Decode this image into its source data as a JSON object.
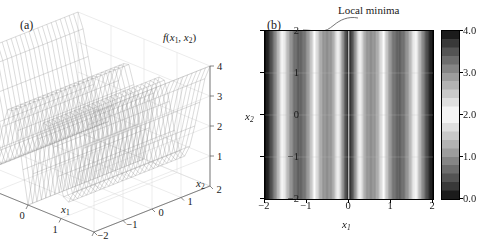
{
  "figure": {
    "panel_a_label": "(a)",
    "panel_b_label": "(b)"
  },
  "panel_a": {
    "z_axis_label": "f(x1, x2)",
    "z_ticks": [
      "4",
      "3",
      "2",
      "1"
    ],
    "x1_axis_label": "x1",
    "x1_ticks": [
      "-2",
      "-1",
      "0",
      "1",
      "2"
    ],
    "x2_axis_label": "x2",
    "x2_ticks": [
      "-2",
      "-1",
      "0",
      "1",
      "2"
    ]
  },
  "panel_b": {
    "annotation": "Local minima",
    "x_axis_label": "x1",
    "y_axis_label": "x2",
    "x_ticks": [
      "-2",
      "-1",
      "0",
      "1",
      "2"
    ],
    "y_ticks": [
      "2",
      "1",
      "0",
      "-1",
      "-2"
    ],
    "colorbar_ticks": [
      "4.0",
      "3.0",
      "2.0",
      "1.0",
      "0.0"
    ],
    "minima_line_x": 0
  },
  "chart_data": [
    {
      "type": "line",
      "title": "(a) 3D wireframe surface of f(x1, x2)",
      "subtitle": "",
      "xlabel": "x1",
      "ylabel": "x2",
      "zlabel": "f(x1, x2)",
      "xlim": [
        -2,
        2
      ],
      "ylim": [
        -2,
        2
      ],
      "zlim": [
        0,
        4
      ],
      "grid": true,
      "legend_position": "none",
      "surface_note": "Valley-shaped oscillatory mesh; function depends on x1 only, constant along x2",
      "x": [
        -2,
        -1.75,
        -1.5,
        -1.25,
        -1,
        -0.75,
        -0.5,
        -0.25,
        0,
        0.25,
        0.5,
        0.75,
        1,
        1.25,
        1.5,
        1.75,
        2
      ],
      "values": [
        4.0,
        3.1,
        1.6,
        0.5,
        0.9,
        2.2,
        3.0,
        2.3,
        0.0,
        2.3,
        3.0,
        2.2,
        0.9,
        0.5,
        1.6,
        3.1,
        4.0
      ]
    },
    {
      "type": "heatmap",
      "title": "(b) Contour map of f(x1, x2)",
      "xlabel": "x1",
      "ylabel": "x2",
      "xlim": [
        -2,
        2
      ],
      "ylim": [
        -2,
        2
      ],
      "zlim": [
        0,
        4
      ],
      "grid": true,
      "legend_position": "right",
      "colormap": "gray-inverted-v",
      "colorbar_range": [
        0.0,
        4.0
      ],
      "colorbar_ticks": [
        0.0,
        1.0,
        2.0,
        3.0,
        4.0
      ],
      "annotation": "Local minima",
      "annotation_x": 0,
      "x": [
        -2,
        -1.9,
        -1.8,
        -1.7,
        -1.6,
        -1.5,
        -1.4,
        -1.3,
        -1.2,
        -1.1,
        -1,
        -0.9,
        -0.8,
        -0.7,
        -0.6,
        -0.5,
        -0.4,
        -0.3,
        -0.2,
        -0.1,
        0,
        0.1,
        0.2,
        0.3,
        0.4,
        0.5,
        0.6,
        0.7,
        0.8,
        0.9,
        1,
        1.1,
        1.2,
        1.3,
        1.4,
        1.5,
        1.6,
        1.7,
        1.8,
        1.9,
        2
      ],
      "values": [
        4.0,
        3.75,
        3.3,
        2.7,
        2.1,
        1.6,
        1.1,
        0.75,
        0.6,
        0.7,
        0.95,
        1.5,
        2.1,
        2.65,
        2.95,
        3.0,
        2.85,
        2.3,
        1.5,
        0.65,
        0.0,
        0.65,
        1.5,
        2.3,
        2.85,
        3.0,
        2.95,
        2.65,
        2.1,
        1.5,
        0.95,
        0.7,
        0.6,
        0.75,
        1.1,
        1.6,
        2.1,
        2.7,
        3.3,
        3.75,
        4.0
      ]
    }
  ]
}
